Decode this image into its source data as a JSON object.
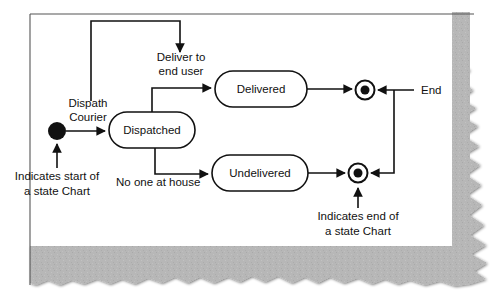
{
  "diagram": {
    "type": "uml-state-chart",
    "colors": {
      "background": "#ffffff",
      "stroke": "#111111",
      "torn_paper_gray": "#b5b5b5",
      "torn_paper_gray_dark": "#8f8f8f",
      "page_border": "#555555"
    },
    "states": [
      {
        "id": "dispatched",
        "label": "Dispatched",
        "shape": "rounded-rect",
        "cx": 152,
        "cy": 130,
        "w": 86,
        "h": 36
      },
      {
        "id": "delivered",
        "label": "Delivered",
        "shape": "rounded-rect",
        "cx": 261,
        "cy": 89,
        "w": 92,
        "h": 36
      },
      {
        "id": "undelivered",
        "label": "Undelivered",
        "shape": "rounded-rect",
        "cx": 260,
        "cy": 173,
        "w": 96,
        "h": 36
      }
    ],
    "pseudo_states": [
      {
        "id": "initial",
        "kind": "initial-state",
        "cx": 57,
        "cy": 131,
        "r": 9
      },
      {
        "id": "final-top",
        "kind": "final-state",
        "cx": 365,
        "cy": 90,
        "r": 10
      },
      {
        "id": "final-bottom",
        "kind": "final-state",
        "cx": 358,
        "cy": 173,
        "r": 10
      }
    ],
    "transitions": [
      {
        "id": "initial-to-dispatched",
        "label": "Dispath\nCourier",
        "from": "initial",
        "to": "dispatched"
      },
      {
        "id": "dispatched-to-delivered",
        "label": "Deliver to\nend user",
        "from": "dispatched",
        "to": "delivered"
      },
      {
        "id": "dispatched-to-undelivered",
        "label": "No one at house",
        "from": "dispatched",
        "to": "undelivered"
      },
      {
        "id": "delivered-to-final",
        "label": "",
        "from": "delivered",
        "to": "final-top"
      },
      {
        "id": "undelivered-to-final",
        "label": "",
        "from": "undelivered",
        "to": "final-bottom"
      },
      {
        "id": "end-branch",
        "label": "End",
        "from": "end-line",
        "to": "final-top, final-bottom"
      }
    ],
    "labels": {
      "dispath_courier_line1": "Dispath",
      "dispath_courier_line2": "Courier",
      "deliver_line1": "Deliver to",
      "deliver_line2": "end user",
      "no_one_at_house": "No one at house",
      "end": "End",
      "state_dispatched": "Dispatched",
      "state_delivered": "Delivered",
      "state_undelivered": "Undelivered"
    },
    "annotations": [
      {
        "id": "start-note",
        "line1": "Indicates start of",
        "line2": "a state Chart",
        "points_to": "initial"
      },
      {
        "id": "end-note",
        "line1": "Indicates end of",
        "line2": "a state Chart",
        "points_to": "final-bottom"
      }
    ]
  }
}
